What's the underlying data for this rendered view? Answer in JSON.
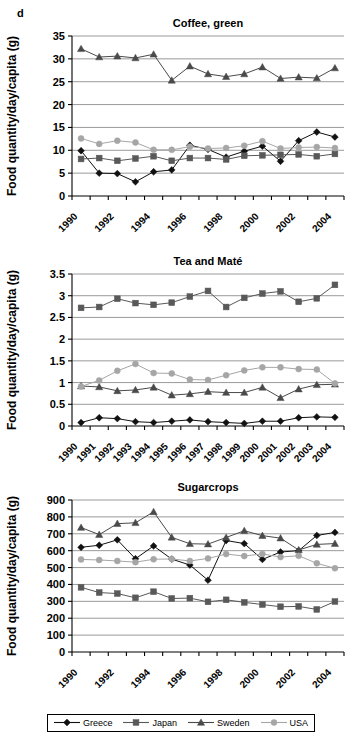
{
  "panel_label": "d",
  "legend": {
    "items": [
      {
        "label": "Greece",
        "marker": "diamond",
        "color": "#111111"
      },
      {
        "label": "Japan",
        "marker": "square",
        "color": "#595959"
      },
      {
        "label": "Sweden",
        "marker": "triangle",
        "color": "#4a4a4a"
      },
      {
        "label": "USA",
        "marker": "circle",
        "color": "#a6a6a6"
      }
    ]
  },
  "charts": [
    {
      "id": "chart-coffee",
      "chart_data": {
        "type": "line",
        "title": "Coffee, green",
        "xlabel": "",
        "ylabel": "Food quantity/day/capita (g)",
        "x": [
          1990,
          1991,
          1992,
          1993,
          1994,
          1995,
          1996,
          1997,
          1998,
          1999,
          2000,
          2001,
          2002,
          2003,
          2004
        ],
        "categories": [
          "1990",
          "1991",
          "1992",
          "1993",
          "1994",
          "1995",
          "1996",
          "1997",
          "1998",
          "1999",
          "2000",
          "2001",
          "2002",
          "2003",
          "2004"
        ],
        "x_tick_labels": [
          "1990",
          "1992",
          "1994",
          "1996",
          "1998",
          "2000",
          "2002",
          "2004"
        ],
        "ylim": [
          0,
          35
        ],
        "yticks": [
          0,
          5,
          10,
          15,
          20,
          25,
          30,
          35
        ],
        "grid": true,
        "legend_position": "bottom",
        "series": [
          {
            "name": "Greece",
            "marker": "diamond",
            "color": "#111111",
            "values": [
              9.9,
              5.0,
              4.9,
              3.1,
              5.3,
              5.7,
              11.1,
              10.2,
              8.5,
              9.8,
              10.9,
              7.6,
              12.1,
              14.0,
              12.9
            ]
          },
          {
            "name": "Japan",
            "marker": "square",
            "color": "#595959",
            "values": [
              8.1,
              8.3,
              7.7,
              8.2,
              8.7,
              7.7,
              8.3,
              8.3,
              8.0,
              8.8,
              8.9,
              9.0,
              9.1,
              8.7,
              9.2
            ]
          },
          {
            "name": "Sweden",
            "marker": "triangle",
            "color": "#4a4a4a",
            "values": [
              32.2,
              30.4,
              30.6,
              30.2,
              31.0,
              25.3,
              28.4,
              26.7,
              26.1,
              26.7,
              28.2,
              25.7,
              26.0,
              25.8,
              28.0
            ]
          },
          {
            "name": "USA",
            "marker": "circle",
            "color": "#a6a6a6",
            "values": [
              12.6,
              11.4,
              12.1,
              11.7,
              10.1,
              10.1,
              10.8,
              10.4,
              10.5,
              11.0,
              12.0,
              10.4,
              10.6,
              10.7,
              10.5
            ]
          }
        ]
      }
    },
    {
      "id": "chart-tea",
      "chart_data": {
        "type": "line",
        "title": "Tea and Maté",
        "xlabel": "",
        "ylabel": "Food quantity/day/capita (g)",
        "x": [
          1990,
          1991,
          1992,
          1993,
          1994,
          1995,
          1996,
          1997,
          1998,
          1999,
          2000,
          2001,
          2002,
          2003,
          2004
        ],
        "categories": [
          "1990",
          "1991",
          "1992",
          "1993",
          "1994",
          "1995",
          "1996",
          "1997",
          "1998",
          "1999",
          "2000",
          "2001",
          "2002",
          "2003",
          "2004"
        ],
        "x_tick_labels": [
          "1990",
          "1991",
          "1992",
          "1993",
          "1994",
          "1995",
          "1996",
          "1997",
          "1998",
          "1999",
          "2000",
          "2001",
          "2002",
          "2003",
          "2004"
        ],
        "ylim": [
          0,
          3.5
        ],
        "yticks": [
          0,
          0.5,
          1,
          1.5,
          2,
          2.5,
          3,
          3.5
        ],
        "ytick_labels": [
          "0",
          "0.5",
          "1",
          "1.5",
          "2",
          "2.5",
          "3",
          "3.5"
        ],
        "grid": true,
        "legend_position": "bottom",
        "series": [
          {
            "name": "Greece",
            "marker": "diamond",
            "color": "#111111",
            "values": [
              0.08,
              0.19,
              0.17,
              0.1,
              0.08,
              0.11,
              0.14,
              0.1,
              0.08,
              0.06,
              0.11,
              0.11,
              0.19,
              0.21,
              0.2
            ]
          },
          {
            "name": "Japan",
            "marker": "square",
            "color": "#595959",
            "values": [
              2.72,
              2.74,
              2.93,
              2.83,
              2.79,
              2.84,
              2.98,
              3.11,
              2.74,
              2.95,
              3.05,
              3.1,
              2.86,
              2.94,
              3.25
            ]
          },
          {
            "name": "Sweden",
            "marker": "triangle",
            "color": "#4a4a4a",
            "values": [
              0.92,
              0.9,
              0.81,
              0.83,
              0.89,
              0.71,
              0.74,
              0.79,
              0.77,
              0.77,
              0.89,
              0.65,
              0.85,
              0.95,
              0.96
            ]
          },
          {
            "name": "USA",
            "marker": "circle",
            "color": "#a6a6a6",
            "values": [
              0.91,
              1.05,
              1.27,
              1.43,
              1.22,
              1.21,
              1.07,
              1.06,
              1.17,
              1.28,
              1.35,
              1.35,
              1.31,
              1.3,
              0.98
            ]
          }
        ]
      }
    },
    {
      "id": "chart-sugar",
      "chart_data": {
        "type": "line",
        "title": "Sugarcrops",
        "xlabel": "",
        "ylabel": "Food quantity/day/capita (g)",
        "x": [
          1990,
          1991,
          1992,
          1993,
          1994,
          1995,
          1996,
          1997,
          1998,
          1999,
          2000,
          2001,
          2002,
          2003,
          2004
        ],
        "categories": [
          "1990",
          "1991",
          "1992",
          "1993",
          "1994",
          "1995",
          "1996",
          "1997",
          "1998",
          "1999",
          "2000",
          "2001",
          "2002",
          "2003",
          "2004"
        ],
        "x_tick_labels": [
          "1990",
          "1992",
          "1994",
          "1996",
          "1998",
          "2000",
          "2002",
          "2004"
        ],
        "ylim": [
          0,
          900
        ],
        "yticks": [
          0,
          100,
          200,
          300,
          400,
          500,
          600,
          700,
          800,
          900
        ],
        "grid": true,
        "legend_position": "bottom",
        "series": [
          {
            "name": "Greece",
            "marker": "diamond",
            "color": "#111111",
            "values": [
              620,
              632,
              664,
              552,
              628,
              550,
              515,
              425,
              660,
              642,
              548,
              592,
              600,
              690,
              708
            ]
          },
          {
            "name": "Japan",
            "marker": "square",
            "color": "#595959",
            "values": [
              383,
              352,
              346,
              321,
              357,
              317,
              319,
              297,
              309,
              294,
              281,
              268,
              270,
              252,
              299
            ]
          },
          {
            "name": "Sweden",
            "marker": "triangle",
            "color": "#4a4a4a",
            "values": [
              737,
              695,
              760,
              765,
              830,
              679,
              641,
              639,
              678,
              718,
              689,
              674,
              604,
              637,
              642
            ]
          },
          {
            "name": "USA",
            "marker": "circle",
            "color": "#a6a6a6",
            "values": [
              548,
              545,
              539,
              532,
              549,
              551,
              539,
              554,
              580,
              568,
              581,
              562,
              570,
              525,
              496
            ]
          }
        ]
      }
    }
  ]
}
